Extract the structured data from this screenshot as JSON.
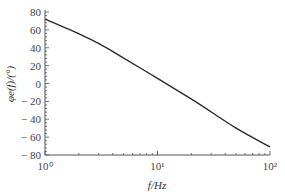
{
  "chart_data": {
    "type": "line",
    "title": "",
    "xlabel": "f/Hz",
    "ylabel": "φe(f)/(°)",
    "xscale": "log",
    "xlim_decades": [
      0,
      2
    ],
    "ylim": [
      -80,
      80
    ],
    "x_tick_labels": [
      "10⁰",
      "10¹",
      "10²"
    ],
    "y_ticks": [
      80,
      60,
      40,
      20,
      0,
      -20,
      -40,
      -60,
      -80
    ],
    "y_tick_labels": [
      "80",
      "60",
      "40",
      "20",
      "0",
      "− 20",
      "− 40",
      "− 60",
      "− 80"
    ],
    "grid": false,
    "legend": null,
    "series": [
      {
        "name": "phase",
        "x_decade_fraction": [
          0.0,
          0.156,
          0.244,
          0.333,
          0.498,
          0.667,
          0.844,
          1.0
        ],
        "values": [
          72,
          55,
          44,
          31,
          6,
          -20,
          -49,
          -71
        ]
      }
    ],
    "colors": {
      "line": "#2b2b2b",
      "axis": "#555555"
    }
  }
}
